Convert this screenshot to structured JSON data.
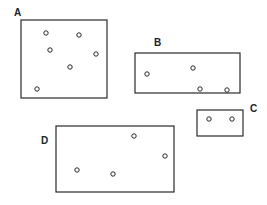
{
  "diagram": {
    "regions": [
      {
        "label": "A",
        "label_pos": [
          14,
          16
        ],
        "rect": {
          "x": 21,
          "y": 20,
          "w": 86,
          "h": 78
        },
        "points": [
          [
            46,
            33
          ],
          [
            79,
            35
          ],
          [
            50,
            50
          ],
          [
            96,
            54
          ],
          [
            70,
            67
          ],
          [
            37,
            89
          ]
        ]
      },
      {
        "label": "B",
        "label_pos": [
          154,
          46
        ],
        "rect": {
          "x": 135,
          "y": 53,
          "w": 105,
          "h": 40
        },
        "points": [
          [
            147,
            74
          ],
          [
            193,
            68
          ],
          [
            200,
            89
          ],
          [
            227,
            90
          ]
        ]
      },
      {
        "label": "C",
        "label_pos": [
          250,
          112
        ],
        "rect": {
          "x": 197,
          "y": 110,
          "w": 46,
          "h": 26
        },
        "points": [
          [
            209,
            119
          ],
          [
            232,
            119
          ]
        ]
      },
      {
        "label": "D",
        "label_pos": [
          41,
          144
        ],
        "rect": {
          "x": 56,
          "y": 126,
          "w": 118,
          "h": 66
        },
        "points": [
          [
            77,
            170
          ],
          [
            113,
            174
          ],
          [
            134,
            136
          ],
          [
            165,
            156
          ]
        ]
      }
    ],
    "point_radius": 2.2,
    "stroke_color": "#2a2a2a"
  }
}
